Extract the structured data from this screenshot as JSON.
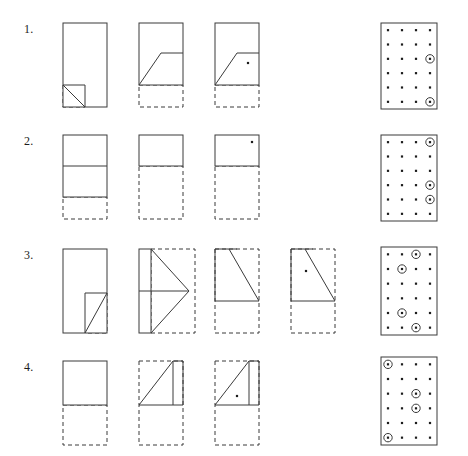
{
  "page": {
    "type": "paper-folding-worksheet",
    "background_color": "#ffffff",
    "line_color": "#3a3a3a",
    "dot_color": "#1c1c1c",
    "rows": 4,
    "problems": [
      {
        "number": "1.",
        "label_x": 24,
        "label_y": 14,
        "row_top": 8,
        "fold_steps": [
          {
            "name": "fold-step-1",
            "x": 60,
            "width": 52,
            "height": 84,
            "solid_rect": {
              "x": 0,
              "y": 0,
              "w": 44,
              "h": 84
            },
            "dashed_rects": [
              {
                "x": 0,
                "y": 62,
                "w": 22,
                "h": 22
              }
            ],
            "solid_lines": [
              {
                "x1": 0,
                "y1": 62,
                "x2": 22,
                "y2": 62
              },
              {
                "x1": 22,
                "y1": 62,
                "x2": 22,
                "y2": 84
              }
            ],
            "diagonals": [
              {
                "x1": 0,
                "y1": 62,
                "x2": 22,
                "y2": 84
              }
            ],
            "dots": []
          },
          {
            "name": "fold-step-2",
            "x": 136,
            "width": 52,
            "height": 84,
            "solid_rect": {
              "x": 0,
              "y": 0,
              "w": 44,
              "h": 62
            },
            "dashed_rects": [
              {
                "x": 0,
                "y": 62,
                "w": 44,
                "h": 22
              }
            ],
            "solid_lines": [
              {
                "x1": 22,
                "y1": 30,
                "x2": 44,
                "y2": 30
              }
            ],
            "diagonals": [
              {
                "x1": 0,
                "y1": 62,
                "x2": 22,
                "y2": 30
              }
            ],
            "dots": []
          },
          {
            "name": "fold-step-3",
            "x": 212,
            "width": 52,
            "height": 84,
            "solid_rect": {
              "x": 0,
              "y": 0,
              "w": 44,
              "h": 62
            },
            "dashed_rects": [
              {
                "x": 0,
                "y": 62,
                "w": 44,
                "h": 22
              }
            ],
            "solid_lines": [
              {
                "x1": 22,
                "y1": 30,
                "x2": 44,
                "y2": 30
              }
            ],
            "diagonals": [
              {
                "x1": 0,
                "y1": 62,
                "x2": 22,
                "y2": 30
              }
            ],
            "dots": [
              {
                "x": 33,
                "y": 40
              }
            ]
          }
        ],
        "answer_grid": {
          "name": "answer-grid-1",
          "x": 378,
          "y": 12,
          "width": 56,
          "height": 86,
          "cols": 4,
          "rows": 6,
          "circled": [
            [
              4,
              3
            ],
            [
              4,
              6
            ]
          ]
        }
      },
      {
        "number": "2.",
        "label_x": 24,
        "label_y": 14,
        "row_top": 120,
        "fold_steps": [
          {
            "name": "fold-step-1",
            "x": 60,
            "width": 52,
            "height": 84,
            "solid_rect": {
              "x": 0,
              "y": 0,
              "w": 44,
              "h": 62
            },
            "dashed_rects": [
              {
                "x": 0,
                "y": 62,
                "w": 44,
                "h": 22
              }
            ],
            "solid_lines": [
              {
                "x1": 0,
                "y1": 31,
                "x2": 44,
                "y2": 31
              }
            ],
            "diagonals": [],
            "dots": []
          },
          {
            "name": "fold-step-2",
            "x": 136,
            "width": 52,
            "height": 84,
            "solid_rect": {
              "x": 0,
              "y": 0,
              "w": 44,
              "h": 31
            },
            "dashed_rects": [
              {
                "x": 0,
                "y": 31,
                "w": 44,
                "h": 53
              }
            ],
            "solid_lines": [],
            "diagonals": [],
            "dots": []
          },
          {
            "name": "fold-step-3",
            "x": 212,
            "width": 52,
            "height": 84,
            "solid_rect": {
              "x": 0,
              "y": 0,
              "w": 44,
              "h": 31
            },
            "dashed_rects": [
              {
                "x": 0,
                "y": 31,
                "w": 44,
                "h": 53
              }
            ],
            "solid_lines": [],
            "diagonals": [],
            "dots": [
              {
                "x": 37,
                "y": 7
              }
            ]
          }
        ],
        "answer_grid": {
          "name": "answer-grid-2",
          "x": 378,
          "y": 12,
          "width": 56,
          "height": 86,
          "cols": 4,
          "rows": 6,
          "circled": [
            [
              4,
              1
            ],
            [
              4,
              4
            ],
            [
              4,
              5
            ]
          ]
        }
      },
      {
        "number": "3.",
        "label_x": 24,
        "label_y": 14,
        "row_top": 234,
        "fold_steps": [
          {
            "name": "fold-step-1",
            "x": 60,
            "width": 52,
            "height": 84,
            "solid_rect": {
              "x": 0,
              "y": 0,
              "w": 44,
              "h": 84
            },
            "dashed_rects": [
              {
                "x": 22,
                "y": 44,
                "w": 22,
                "h": 40
              }
            ],
            "solid_lines": [
              {
                "x1": 22,
                "y1": 44,
                "x2": 44,
                "y2": 44
              },
              {
                "x1": 22,
                "y1": 44,
                "x2": 22,
                "y2": 84
              }
            ],
            "diagonals": [
              {
                "x1": 22,
                "y1": 84,
                "x2": 44,
                "y2": 44
              }
            ],
            "dots": []
          },
          {
            "name": "fold-step-2",
            "x": 136,
            "width": 58,
            "height": 84,
            "solid_rect": {
              "x": 0,
              "y": 0,
              "w": 12,
              "h": 84
            },
            "dashed_rects": [
              {
                "x": 12,
                "y": 0,
                "w": 44,
                "h": 84
              }
            ],
            "solid_lines": [
              {
                "x1": 0,
                "y1": 42,
                "x2": 50,
                "y2": 42
              }
            ],
            "diagonals": [
              {
                "x1": 12,
                "y1": 0,
                "x2": 50,
                "y2": 42
              },
              {
                "x1": 12,
                "y1": 84,
                "x2": 50,
                "y2": 42
              }
            ],
            "dots": []
          },
          {
            "name": "fold-step-3",
            "x": 212,
            "width": 52,
            "height": 84,
            "solid_rect": null,
            "dashed_rects": [
              {
                "x": 0,
                "y": 0,
                "w": 44,
                "h": 84
              }
            ],
            "solid_lines": [
              {
                "x1": 0,
                "y1": 0,
                "x2": 0,
                "y2": 52
              },
              {
                "x1": 0,
                "y1": 0,
                "x2": 22,
                "y2": 0
              },
              {
                "x1": 0,
                "y1": 52,
                "x2": 44,
                "y2": 52
              }
            ],
            "diagonals": [
              {
                "x1": 14,
                "y1": 0,
                "x2": 44,
                "y2": 52
              }
            ],
            "dots": []
          },
          {
            "name": "fold-step-4",
            "x": 288,
            "width": 52,
            "height": 84,
            "solid_rect": null,
            "dashed_rects": [
              {
                "x": 0,
                "y": 0,
                "w": 44,
                "h": 84
              }
            ],
            "solid_lines": [
              {
                "x1": 0,
                "y1": 0,
                "x2": 0,
                "y2": 52
              },
              {
                "x1": 0,
                "y1": 0,
                "x2": 22,
                "y2": 0
              },
              {
                "x1": 0,
                "y1": 52,
                "x2": 44,
                "y2": 52
              }
            ],
            "diagonals": [
              {
                "x1": 14,
                "y1": 0,
                "x2": 44,
                "y2": 52
              }
            ],
            "dots": [
              {
                "x": 15,
                "y": 22
              }
            ]
          }
        ],
        "answer_grid": {
          "name": "answer-grid-3",
          "x": 378,
          "y": 10,
          "width": 56,
          "height": 88,
          "cols": 4,
          "rows": 6,
          "circled": [
            [
              3,
              1
            ],
            [
              2,
              2
            ],
            [
              2,
              5
            ],
            [
              3,
              6
            ]
          ]
        }
      },
      {
        "number": "4.",
        "label_x": 24,
        "label_y": 14,
        "row_top": 346,
        "fold_steps": [
          {
            "name": "fold-step-1",
            "x": 60,
            "width": 52,
            "height": 84,
            "solid_rect": {
              "x": 0,
              "y": 0,
              "w": 44,
              "h": 44
            },
            "dashed_rects": [
              {
                "x": 0,
                "y": 44,
                "w": 44,
                "h": 40
              }
            ],
            "solid_lines": [],
            "diagonals": [],
            "dots": []
          },
          {
            "name": "fold-step-2",
            "x": 136,
            "width": 52,
            "height": 84,
            "solid_rect": null,
            "dashed_rects": [
              {
                "x": 0,
                "y": 0,
                "w": 44,
                "h": 84
              }
            ],
            "solid_lines": [
              {
                "x1": 0,
                "y1": 44,
                "x2": 44,
                "y2": 44
              },
              {
                "x1": 34,
                "y1": 0,
                "x2": 34,
                "y2": 44
              },
              {
                "x1": 44,
                "y1": 0,
                "x2": 44,
                "y2": 44
              },
              {
                "x1": 34,
                "y1": 0,
                "x2": 44,
                "y2": 0
              }
            ],
            "diagonals": [
              {
                "x1": 0,
                "y1": 44,
                "x2": 34,
                "y2": 0
              }
            ],
            "dots": []
          },
          {
            "name": "fold-step-3",
            "x": 212,
            "width": 52,
            "height": 84,
            "solid_rect": null,
            "dashed_rects": [
              {
                "x": 0,
                "y": 0,
                "w": 44,
                "h": 84
              }
            ],
            "solid_lines": [
              {
                "x1": 0,
                "y1": 44,
                "x2": 44,
                "y2": 44
              },
              {
                "x1": 34,
                "y1": 0,
                "x2": 34,
                "y2": 44
              },
              {
                "x1": 44,
                "y1": 0,
                "x2": 44,
                "y2": 44
              },
              {
                "x1": 34,
                "y1": 0,
                "x2": 44,
                "y2": 0
              }
            ],
            "diagonals": [
              {
                "x1": 0,
                "y1": 44,
                "x2": 34,
                "y2": 0
              }
            ],
            "dots": [
              {
                "x": 22,
                "y": 35
              }
            ]
          }
        ],
        "answer_grid": {
          "name": "answer-grid-4",
          "x": 378,
          "y": 8,
          "width": 56,
          "height": 88,
          "cols": 4,
          "rows": 6,
          "circled": [
            [
              1,
              1
            ],
            [
              3,
              3
            ],
            [
              3,
              4
            ],
            [
              1,
              6
            ]
          ]
        }
      }
    ]
  }
}
